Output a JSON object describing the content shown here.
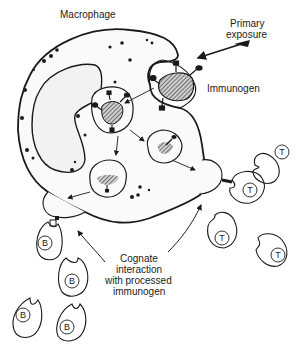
{
  "labels": {
    "macrophage": "Macrophage",
    "primary_exposure_1": "Primary",
    "primary_exposure_2": "exposure",
    "immunogen": "Immunogen",
    "cognate_1": "Cognate",
    "cognate_2": "interaction",
    "cognate_3": "with processed",
    "cognate_4": "immunogen"
  },
  "cells": {
    "t_label": "T",
    "b_label": "B"
  },
  "colors": {
    "line": "#1a1a1a",
    "fill": "#f7f7f7",
    "hatch": "#333333"
  }
}
